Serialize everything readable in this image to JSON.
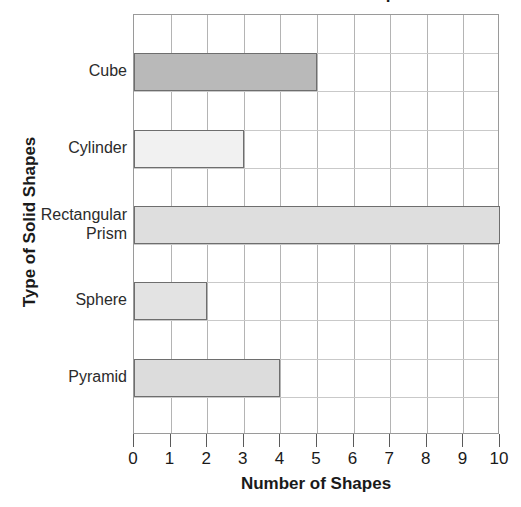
{
  "chart_data": {
    "type": "bar",
    "orientation": "horizontal",
    "title": "Number of Solid Shapes",
    "xlabel": "Number of Shapes",
    "ylabel": "Type of Solid Shapes",
    "categories": [
      "Cube",
      "Cylinder",
      "Rectangular Prism",
      "Sphere",
      "Pyramid"
    ],
    "values": [
      5,
      3,
      10,
      2,
      4
    ],
    "bars": [
      {
        "label": "Cube",
        "label_line1": "Cube",
        "label_line2": "",
        "value": 5,
        "color": "#b9b9b9"
      },
      {
        "label": "Cylinder",
        "label_line1": "Cylinder",
        "label_line2": "",
        "value": 3,
        "color": "#f1f1f1"
      },
      {
        "label": "Rectangular Prism",
        "label_line1": "Rectangular",
        "label_line2": "Prism",
        "value": 10,
        "color": "#dedede"
      },
      {
        "label": "Sphere",
        "label_line1": "Sphere",
        "label_line2": "",
        "value": 2,
        "color": "#e3e3e3"
      },
      {
        "label": "Pyramid",
        "label_line1": "Pyramid",
        "label_line2": "",
        "value": 4,
        "color": "#dcdcdc"
      }
    ],
    "xlim": [
      0,
      10
    ],
    "xticks": [
      "0",
      "1",
      "2",
      "3",
      "4",
      "5",
      "6",
      "7",
      "8",
      "9",
      "10"
    ],
    "grid": true,
    "legend": "none",
    "axis_color": "#9a9a9a",
    "gridline_color": "#b4b4b4",
    "bar_edge_color": "#6e6e6e",
    "text_color": "#1a1a1a"
  }
}
